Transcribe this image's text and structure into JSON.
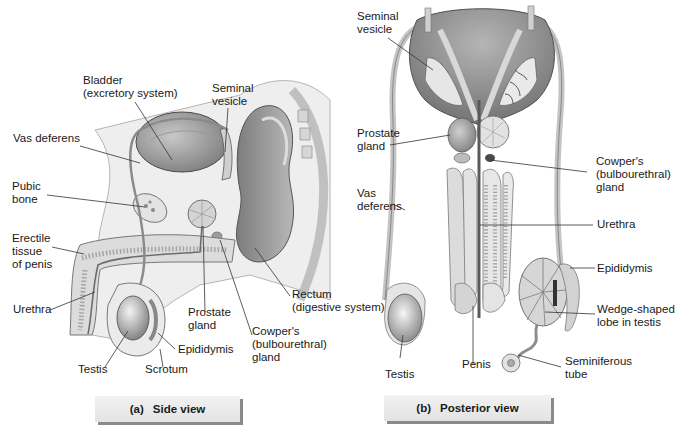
{
  "figure": {
    "panels": [
      {
        "id": "a",
        "caption": {
          "tag": "(a)",
          "title": "Side view"
        },
        "labels": {
          "bladder": "Bladder\n(excretory system)",
          "seminal_vesicle": "Seminal\nvesicle",
          "vas_deferens": "Vas deferens",
          "pubic_bone": "Pubic\nbone",
          "erectile_tissue": "Erectile\ntissue\nof penis",
          "urethra": "Urethra",
          "rectum": "Rectum\n(digestive system)",
          "prostate_gland": "Prostate\ngland",
          "cowpers_gland": "Cowper's\n(bulbourethral)\ngland",
          "epididymis": "Epididymis",
          "testis": "Testis",
          "scrotum": "Scrotum"
        }
      },
      {
        "id": "b",
        "caption": {
          "tag": "(b)",
          "title": "Posterior view"
        },
        "labels": {
          "seminal_vesicle": "Seminal\nvesicle",
          "prostate_gland": "Prostate\ngland",
          "cowpers_gland": "Cowper's\n(bulbourethral)\ngland",
          "vas_deferens": "Vas\ndeferens",
          "urethra": "Urethra",
          "epididymis": "Epididymis",
          "wedge_lobe": "Wedge-shaped\nlobe in testis",
          "penis": "Penis",
          "testis": "Testis",
          "seminiferous_tube": "Seminiferous\ntube"
        }
      }
    ],
    "colors": {
      "tissue_light": "#d9d9d9",
      "tissue_mid": "#a9a9a9",
      "tissue_dark": "#6f6f6f",
      "leader_line": "#333333",
      "caption_bg": "#ececec",
      "caption_shadow": "#8a8a8a"
    }
  }
}
